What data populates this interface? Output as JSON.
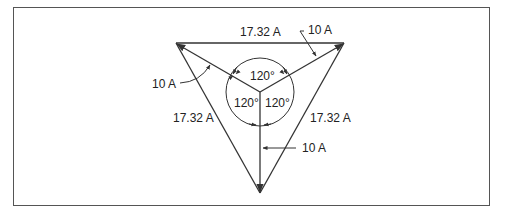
{
  "figure": {
    "labels": {
      "top_side": "17.32 A",
      "left_side": "17.32 A",
      "right_side": "17.32 A",
      "phasor_top_right": "10 A",
      "phasor_left": "10 A",
      "phasor_bottom": "10 A",
      "angle_top": "120°",
      "angle_left": "120°",
      "angle_right": "120°"
    },
    "colors": {
      "line": "#333333",
      "background": "#ffffff"
    }
  }
}
